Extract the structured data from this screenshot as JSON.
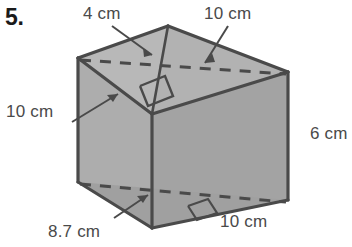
{
  "problem": {
    "number": "5."
  },
  "figure": {
    "name": "triangular-prism",
    "fill_color": "#a8a8a8",
    "fill_color_light": "#b8b8b8",
    "fill_color_dark": "#9c9c9c",
    "stroke_color": "#4a4a4a",
    "label_color": "#4a4a4a"
  },
  "labels": {
    "top_slant": "4 cm",
    "top_right": "10 cm",
    "left_side": "10 cm",
    "right_height": "6 cm",
    "bottom_front": "10 cm",
    "bottom_diagonal": "8.7 cm"
  }
}
